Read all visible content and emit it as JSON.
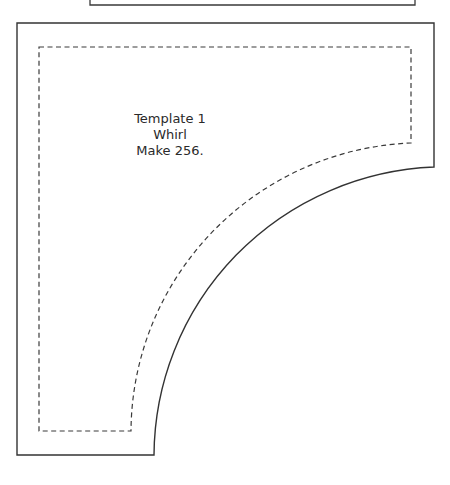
{
  "template": {
    "title": "Template 1",
    "name": "Whirl",
    "instruction": "Make 256."
  },
  "colors": {
    "cut_line": "#3a3a3a",
    "seam_line": "#3a3a3a",
    "background": "#ffffff"
  },
  "lines": {
    "cut_line": "solid",
    "seam_line": "dashed"
  }
}
